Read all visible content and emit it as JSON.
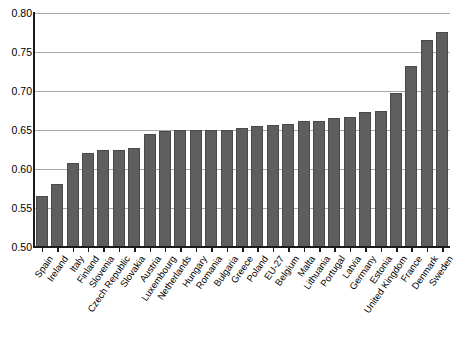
{
  "chart_data": {
    "type": "bar",
    "title": "",
    "subtitle": "",
    "xlabel": "",
    "ylabel": "",
    "ylim": [
      0.5,
      0.8
    ],
    "ytick_labels": [
      "0.80",
      "0.75",
      "0.70",
      "0.65",
      "0.60",
      "0.55",
      "0.50"
    ],
    "ytick_values": [
      0.8,
      0.75,
      0.7,
      0.65,
      0.6,
      0.55,
      0.5
    ],
    "grid": true,
    "legend": false,
    "legend_position": "none",
    "bar_color": "#5e5e5e",
    "bar_edge_color": "#4a4a4a",
    "axis_color": "#1a1a1a",
    "grid_color": "#a8a8a8",
    "categories": [
      "Spain",
      "Ireland",
      "Italy",
      "Finland",
      "Slovenia",
      "Czech Republic",
      "Slovakia",
      "Austria",
      "Luxembourg",
      "Netherlands",
      "Hungary",
      "Romania",
      "Bulgaria",
      "Greece",
      "Poland",
      "EU-27",
      "Belgium",
      "Malta",
      "Lithuania",
      "Portugal",
      "Latvia",
      "Germany",
      "Estonia",
      "United Kingdom",
      "France",
      "Denmark",
      "Sweden"
    ],
    "values": [
      0.565,
      0.581,
      0.608,
      0.621,
      0.624,
      0.625,
      0.627,
      0.645,
      0.649,
      0.65,
      0.65,
      0.65,
      0.65,
      0.652,
      0.655,
      0.657,
      0.658,
      0.661,
      0.662,
      0.665,
      0.667,
      0.673,
      0.675,
      0.697,
      0.732,
      0.765,
      0.776
    ]
  }
}
